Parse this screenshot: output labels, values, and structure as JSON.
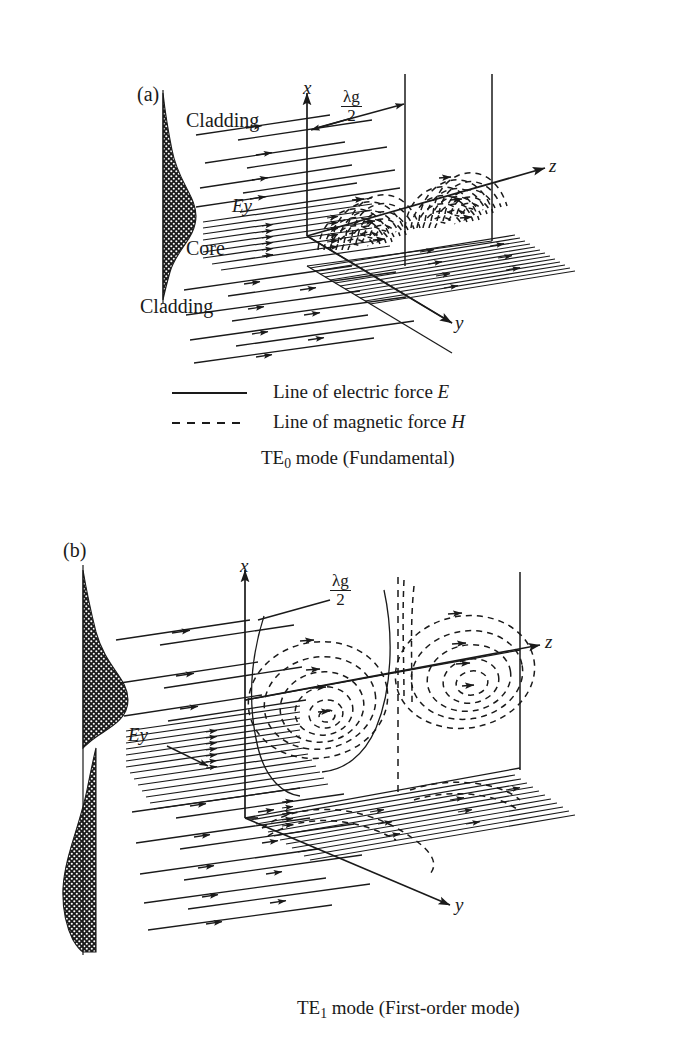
{
  "figure": {
    "background": "#ffffff",
    "ink": "#1a1a1a"
  },
  "panels": [
    {
      "tag": "(a)",
      "mode_caption_prefix": "TE",
      "mode_caption_sub": "0",
      "mode_caption_suffix": " mode (Fundamental)",
      "axes": {
        "x": "x",
        "y": "y",
        "z": "z"
      },
      "period_label": {
        "numerator": "λg",
        "denominator": "2"
      },
      "region_labels": {
        "cladding_top": "Cladding",
        "core": "Core",
        "cladding_bottom": "Cladding",
        "field_profile": "Ey"
      },
      "profile": {
        "type": "gaussian",
        "lobes": 1,
        "description": "single symmetric lobe, cross-hatched fill"
      }
    },
    {
      "tag": "(b)",
      "mode_caption_prefix": "TE",
      "mode_caption_sub": "1",
      "mode_caption_suffix": " mode (First-order mode)",
      "axes": {
        "x": "x",
        "y": "y",
        "z": "z"
      },
      "period_label": {
        "numerator": "λg",
        "denominator": "2"
      },
      "region_labels": {
        "field_profile": "Ey"
      },
      "profile": {
        "type": "antisymmetric",
        "lobes": 2,
        "description": "two antisymmetric lobes, cross-hatched fill"
      }
    }
  ],
  "legend": {
    "items": [
      {
        "style": "solid",
        "label": "Line of electric force ",
        "symbol": "E"
      },
      {
        "style": "dashed",
        "label": "Line of magnetic force ",
        "symbol": "H"
      }
    ]
  }
}
